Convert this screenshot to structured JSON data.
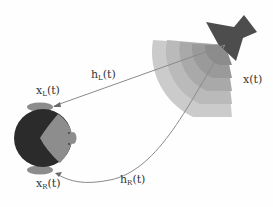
{
  "diagram": {
    "source": {
      "label": "x(t)",
      "icon": "loudspeaker-icon",
      "color": "#4a4a4a"
    },
    "sound_field": {
      "rings": 5,
      "colors": [
        "#c8c8c8",
        "#b8b8b8",
        "#a8a8a8",
        "#989898",
        "#8a8a8a"
      ]
    },
    "paths": [
      {
        "name": "h_L",
        "label_main": "h",
        "label_sub": "L",
        "label_suffix": "(t)"
      },
      {
        "name": "h_R",
        "label_main": "h",
        "label_sub": "R",
        "label_suffix": "(t)"
      }
    ],
    "listener": {
      "icon": "head-icon",
      "left_ear": {
        "label_main": "x",
        "label_sub": "L",
        "label_suffix": "(t)"
      },
      "right_ear": {
        "label_main": "x",
        "label_sub": "R",
        "label_suffix": "(t)"
      },
      "hair_color": "#2a2a2a",
      "face_color": "#8a8a8a"
    },
    "line_color": "#8a8a8a"
  }
}
